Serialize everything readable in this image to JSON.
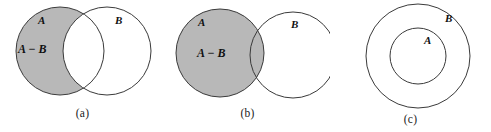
{
  "figure": {
    "kind": "venn-diagram-set-difference",
    "background_color": "#ffffff",
    "shade_color": "#b8b8b8",
    "stroke_color": "#3a3a3a",
    "label_color": "#111111"
  },
  "panels": [
    {
      "id": "a",
      "caption": "(a)",
      "case": "overlapping",
      "shaded_region": "A minus B",
      "labels": {
        "set_a": "A",
        "difference": "A − B",
        "set_b": "B"
      },
      "geometry": {
        "circle_a": {
          "cx": 60,
          "cy": 51,
          "r": 44
        },
        "circle_b": {
          "cx": 107,
          "cy": 51,
          "r": 44
        }
      }
    },
    {
      "id": "b",
      "caption": "(b)",
      "case": "disjoint",
      "shaded_region": "all of A",
      "labels": {
        "set_a": "A",
        "difference": "A − B",
        "set_b": "B"
      },
      "geometry": {
        "circle_a": {
          "cx": 55,
          "cy": 53,
          "r": 44
        },
        "circle_b": {
          "cx": 128,
          "cy": 55,
          "r": 43
        }
      }
    },
    {
      "id": "c",
      "caption": "(c)",
      "case": "a-subset-of-b",
      "shaded_region": "none",
      "labels": {
        "set_a": "A",
        "set_b": "B"
      },
      "geometry": {
        "circle_b": {
          "cx": 88,
          "cy": 56,
          "r": 52
        },
        "circle_a": {
          "cx": 88,
          "cy": 56,
          "r": 28
        }
      }
    }
  ]
}
